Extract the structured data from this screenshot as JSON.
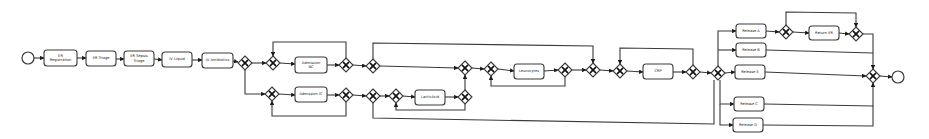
{
  "diagram": {
    "type": "BPMN process model",
    "start_event": {
      "x": 28,
      "y": 58,
      "r": 6
    },
    "end_event": {
      "x": 898,
      "y": 77,
      "r": 6
    },
    "tasks": [
      {
        "id": "t1",
        "label": "ER Registration",
        "lines": [
          "ER",
          "Registration"
        ],
        "x": 44,
        "y": 50,
        "w": 33,
        "h": 16
      },
      {
        "id": "t2",
        "label": "ER Triage",
        "lines": [
          "ER Triage"
        ],
        "x": 86,
        "y": 51,
        "w": 30,
        "h": 15
      },
      {
        "id": "t3",
        "label": "ER Sepsis Triage",
        "lines": [
          "ER Sepsis",
          "Triage"
        ],
        "x": 124,
        "y": 51,
        "w": 30,
        "h": 15
      },
      {
        "id": "t4",
        "label": "IV Liquid",
        "lines": [
          "IV Liquid"
        ],
        "x": 162,
        "y": 52,
        "w": 30,
        "h": 15
      },
      {
        "id": "t5",
        "label": "IV Antibiotics",
        "lines": [
          "IV Antibiotics"
        ],
        "x": 202,
        "y": 53,
        "w": 31,
        "h": 15
      },
      {
        "id": "t6",
        "label": "Admission NC",
        "lines": [
          "Admission",
          "NC"
        ],
        "x": 295,
        "y": 57,
        "w": 32,
        "h": 16
      },
      {
        "id": "t7",
        "label": "Admission IC",
        "lines": [
          "Admission IC"
        ],
        "x": 295,
        "y": 87,
        "w": 32,
        "h": 15
      },
      {
        "id": "t8",
        "label": "LacticAcid",
        "lines": [
          "LacticAcid"
        ],
        "x": 415,
        "y": 90,
        "w": 30,
        "h": 15
      },
      {
        "id": "t9",
        "label": "Leucocytes",
        "lines": [
          "Leucocytes"
        ],
        "x": 514,
        "y": 64,
        "w": 30,
        "h": 15
      },
      {
        "id": "t10",
        "label": "CRP",
        "lines": [
          "CRP"
        ],
        "x": 643,
        "y": 64,
        "w": 30,
        "h": 15
      },
      {
        "id": "t11",
        "label": "Release A",
        "lines": [
          "Release A"
        ],
        "x": 736,
        "y": 24,
        "w": 30,
        "h": 14
      },
      {
        "id": "t12",
        "label": "Return ER",
        "lines": [
          "Return ER"
        ],
        "x": 809,
        "y": 26,
        "w": 30,
        "h": 14
      },
      {
        "id": "t13",
        "label": "Release B",
        "lines": [
          "Release B"
        ],
        "x": 736,
        "y": 43,
        "w": 30,
        "h": 14
      },
      {
        "id": "t14",
        "label": "Release E",
        "lines": [
          "Release E"
        ],
        "x": 735,
        "y": 65,
        "w": 30,
        "h": 14
      },
      {
        "id": "t15",
        "label": "Release C",
        "lines": [
          "Release C"
        ],
        "x": 734,
        "y": 97,
        "w": 30,
        "h": 14
      },
      {
        "id": "t16",
        "label": "Release D",
        "lines": [
          "Release D"
        ],
        "x": 733,
        "y": 118,
        "w": 30,
        "h": 14
      }
    ],
    "gateways": [
      {
        "id": "g1",
        "type": "exclusive",
        "symbol": "X",
        "x": 245,
        "y": 63
      },
      {
        "id": "g2",
        "type": "exclusive",
        "symbol": "X",
        "x": 273,
        "y": 63
      },
      {
        "id": "g3",
        "type": "exclusive",
        "symbol": "X",
        "x": 346,
        "y": 65
      },
      {
        "id": "g4",
        "type": "exclusive",
        "symbol": "X",
        "x": 373,
        "y": 66
      },
      {
        "id": "g5",
        "type": "exclusive",
        "symbol": "X",
        "x": 272,
        "y": 94
      },
      {
        "id": "g6",
        "type": "exclusive",
        "symbol": "X",
        "x": 346,
        "y": 95
      },
      {
        "id": "g7",
        "type": "exclusive",
        "symbol": "X",
        "x": 373,
        "y": 96
      },
      {
        "id": "g8",
        "type": "exclusive",
        "symbol": "X",
        "x": 396,
        "y": 96
      },
      {
        "id": "g9",
        "type": "exclusive",
        "symbol": "X",
        "x": 465,
        "y": 97
      },
      {
        "id": "g10",
        "type": "exclusive",
        "symbol": "X",
        "x": 465,
        "y": 68
      },
      {
        "id": "g11",
        "type": "exclusive",
        "symbol": "X",
        "x": 491,
        "y": 69
      },
      {
        "id": "g12",
        "type": "exclusive",
        "symbol": "X",
        "x": 565,
        "y": 70
      },
      {
        "id": "g13",
        "type": "exclusive",
        "symbol": "X",
        "x": 593,
        "y": 70
      },
      {
        "id": "g14",
        "type": "exclusive",
        "symbol": "X",
        "x": 620,
        "y": 71
      },
      {
        "id": "g15",
        "type": "exclusive",
        "symbol": "X",
        "x": 693,
        "y": 72
      },
      {
        "id": "g16",
        "type": "exclusive",
        "symbol": "X",
        "x": 718,
        "y": 73
      },
      {
        "id": "g17",
        "type": "exclusive",
        "symbol": "X",
        "x": 786,
        "y": 32
      },
      {
        "id": "g18",
        "type": "exclusive",
        "symbol": "X",
        "x": 856,
        "y": 34
      },
      {
        "id": "g19",
        "type": "exclusive",
        "symbol": "X",
        "x": 873,
        "y": 76
      }
    ],
    "flows": [
      {
        "d": "M34,58 L44,58",
        "arrow": true
      },
      {
        "d": "M77,58 L86,58",
        "arrow": true
      },
      {
        "d": "M116,59 L124,59",
        "arrow": true
      },
      {
        "d": "M154,59 L162,60",
        "arrow": true
      },
      {
        "d": "M192,60 L202,60",
        "arrow": true
      },
      {
        "d": "M233,61 L238,62",
        "arrow": true
      },
      {
        "d": "M252,63 L266,63",
        "arrow": true
      },
      {
        "d": "M280,63 L295,64",
        "arrow": true
      },
      {
        "d": "M327,65 L339,65",
        "arrow": true
      },
      {
        "d": "M353,65 L366,66",
        "arrow": true
      },
      {
        "d": "M346,58 L346,42 L273,42 L273,56",
        "arrow": true
      },
      {
        "d": "M245,70 L245,94 L265,94",
        "arrow": true
      },
      {
        "d": "M279,94 L295,95",
        "arrow": true
      },
      {
        "d": "M327,95 L339,95",
        "arrow": true
      },
      {
        "d": "M346,102 L346,116 L272,116 L272,101",
        "arrow": true
      },
      {
        "d": "M353,95 L366,96",
        "arrow": true
      },
      {
        "d": "M380,96 L389,96",
        "arrow": true
      },
      {
        "d": "M403,96 L415,97",
        "arrow": true
      },
      {
        "d": "M445,97 L458,97",
        "arrow": true
      },
      {
        "d": "M465,104 L465,110 L396,110 L396,103",
        "arrow": true
      },
      {
        "d": "M465,90 L465,75",
        "arrow": true
      },
      {
        "d": "M380,66 L458,68",
        "arrow": true
      },
      {
        "d": "M472,68 L484,69",
        "arrow": true
      },
      {
        "d": "M498,69 L514,71",
        "arrow": true
      },
      {
        "d": "M544,71 L558,70",
        "arrow": true
      },
      {
        "d": "M565,77 L565,86 L491,86 L491,76",
        "arrow": true
      },
      {
        "d": "M572,70 L586,70",
        "arrow": true
      },
      {
        "d": "M373,59 L373,43 L593,46 L593,63",
        "arrow": true
      },
      {
        "d": "M600,70 L613,71",
        "arrow": true
      },
      {
        "d": "M627,71 L643,72",
        "arrow": true
      },
      {
        "d": "M673,72 L686,72",
        "arrow": true
      },
      {
        "d": "M693,65 L693,49 L620,48 L620,64",
        "arrow": true
      },
      {
        "d": "M700,72 L711,73",
        "arrow": true
      },
      {
        "d": "M373,103 L373,118 L714,124 L714,80",
        "arrow": false
      },
      {
        "d": "M718,66 L718,31 L736,31",
        "arrow": true
      },
      {
        "d": "M718,50 L736,50",
        "arrow": true
      },
      {
        "d": "M725,73 L735,72",
        "arrow": true
      },
      {
        "d": "M720,80 L720,104 L734,104",
        "arrow": true
      },
      {
        "d": "M720,104 L720,125 L733,125",
        "arrow": true
      },
      {
        "d": "M766,31 L779,32",
        "arrow": true
      },
      {
        "d": "M793,32 L809,33",
        "arrow": true
      },
      {
        "d": "M839,33 L849,34",
        "arrow": true
      },
      {
        "d": "M786,25 L786,12 L856,13 L856,27",
        "arrow": true
      },
      {
        "d": "M863,34 L873,34 L873,69",
        "arrow": true
      },
      {
        "d": "M766,50 L873,53",
        "arrow": false
      },
      {
        "d": "M765,72 L866,76",
        "arrow": true
      },
      {
        "d": "M764,104 L873,106 L873,83",
        "arrow": true
      },
      {
        "d": "M763,125 L873,126 L873,106",
        "arrow": false
      },
      {
        "d": "M880,76 L892,77",
        "arrow": true
      }
    ]
  }
}
